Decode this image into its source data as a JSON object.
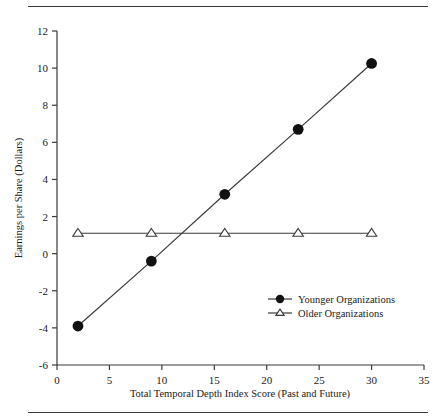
{
  "figure": {
    "background": "#ffffff",
    "line_color": "#3a3a3a",
    "marker_color": "#111111"
  },
  "chart_data": {
    "type": "line",
    "title": "",
    "xlabel": "Total Temporal Depth Index Score (Past and Future)",
    "ylabel": "Earnings per Share (Dollars)",
    "xlim": [
      0,
      35
    ],
    "ylim": [
      -6,
      12
    ],
    "xticks": [
      0,
      5,
      10,
      15,
      20,
      25,
      30,
      35
    ],
    "yticks": [
      -6,
      -4,
      -2,
      0,
      2,
      4,
      6,
      8,
      10,
      12
    ],
    "xtick_labels": [
      "0",
      "5",
      "10",
      "15",
      "20",
      "25",
      "30",
      "35"
    ],
    "ytick_labels": [
      "-6",
      "-4",
      "-2",
      "0",
      "2",
      "4",
      "6",
      "8",
      "10",
      "12"
    ],
    "grid": false,
    "legend_position": "lower right",
    "x": [
      2,
      9,
      16,
      23,
      30
    ],
    "series": [
      {
        "name": "Younger Organizations",
        "marker": "filled-circle",
        "values": [
          -3.9,
          -0.4,
          3.2,
          6.7,
          10.25
        ]
      },
      {
        "name": "Older Organizations",
        "marker": "open-triangle",
        "values": [
          1.1,
          1.1,
          1.1,
          1.1,
          1.1
        ]
      }
    ]
  },
  "legend": {
    "entries": [
      {
        "label": "Younger Organizations",
        "marker": "filled-circle"
      },
      {
        "label": "Older Organizations",
        "marker": "open-triangle"
      }
    ]
  }
}
